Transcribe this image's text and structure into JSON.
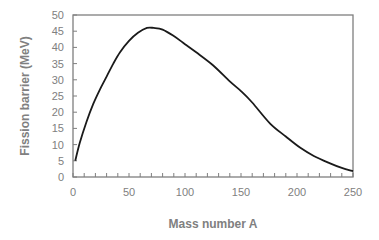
{
  "chart_data": {
    "type": "line",
    "title": "",
    "xlabel": "Mass number A",
    "ylabel": "Fission barrier (MeV)",
    "xlim": [
      0,
      250
    ],
    "ylim": [
      0,
      50
    ],
    "x_ticks": [
      0,
      50,
      100,
      150,
      200,
      250
    ],
    "y_ticks": [
      0,
      5,
      10,
      15,
      20,
      25,
      30,
      35,
      40,
      45,
      50
    ],
    "x_minor_tick_step": 10,
    "grid": false,
    "legend": null,
    "frame": "box",
    "series": [
      {
        "name": "Fission barrier",
        "color": "#1a1a1a",
        "x": [
          2,
          6,
          12,
          18,
          24,
          30,
          36,
          42,
          50,
          58,
          66,
          72,
          80,
          90,
          100,
          110,
          125,
          140,
          150,
          160,
          176,
          190,
          203,
          215,
          229,
          240,
          250
        ],
        "y": [
          5,
          10.5,
          17,
          22.5,
          27,
          31,
          35,
          38.5,
          42,
          44.5,
          46,
          46,
          45.5,
          43.5,
          41,
          38.5,
          34.5,
          29.5,
          26.5,
          23,
          16.5,
          12.5,
          9,
          6.5,
          4.3,
          2.8,
          1.8
        ]
      }
    ]
  }
}
